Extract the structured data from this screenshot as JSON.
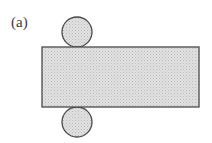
{
  "figure": {
    "label": "(a)",
    "colors": {
      "stroke": "#4a4a4a",
      "fill": "#d4d4d4",
      "background": "#ffffff"
    },
    "shapes": {
      "rectangle": {
        "x": 42,
        "y": 47,
        "width": 157,
        "height": 60
      },
      "top_circle": {
        "cx": 77,
        "cy": 32,
        "r": 15
      },
      "bottom_circle": {
        "cx": 77,
        "cy": 122,
        "r": 15
      }
    }
  }
}
